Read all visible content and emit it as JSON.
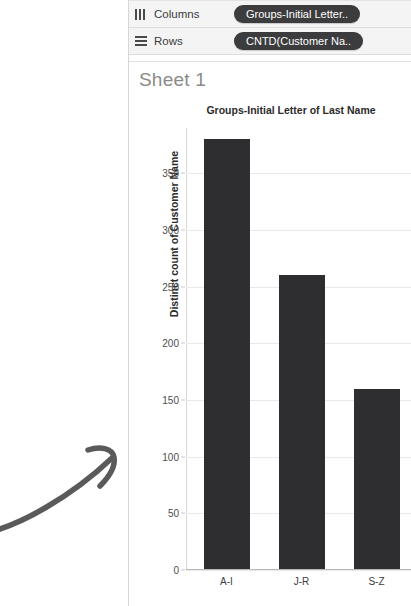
{
  "shelves": {
    "rows": [
      {
        "icon": "columns-shelf-icon",
        "label": "Columns",
        "pill": "Groups-Initial Letter.."
      },
      {
        "icon": "rows-shelf-icon",
        "label": "Rows",
        "pill": "CNTD(Customer Na.."
      }
    ]
  },
  "worksheet": {
    "title": "Sheet 1"
  },
  "colors": {
    "bar": "#2e2e30",
    "pill": "#3c3c3e",
    "shelf_bg": "#f4f4f4",
    "annotation": "#5a5a5a"
  },
  "annotation": {
    "name": "hand-drawn-arrow"
  },
  "chart_data": {
    "type": "bar",
    "title": "Groups-Initial Letter of Last Name",
    "xlabel": "",
    "ylabel": "Distinct count of Customer Name",
    "categories": [
      "A-I",
      "J-R",
      "S-Z"
    ],
    "values": [
      379,
      259,
      159
    ],
    "yticks": [
      0,
      50,
      100,
      150,
      200,
      250,
      300,
      350
    ],
    "ytick_labels": [
      "0",
      "50",
      "100",
      "150",
      "200",
      "250",
      "300",
      "350"
    ],
    "ylim": [
      0,
      390
    ],
    "grid": true,
    "legend": "none"
  }
}
